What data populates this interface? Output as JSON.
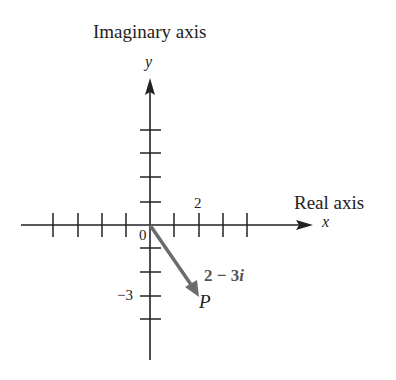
{
  "axes": {
    "imaginary_axis_title": "Imaginary axis",
    "real_axis_title": "Real axis",
    "y_variable": "y",
    "x_variable": "x"
  },
  "ticks": {
    "x_label_2": "2",
    "origin": "0",
    "y_label_neg3": "−3",
    "x_tick_count_positive": 4,
    "x_tick_count_negative": 4,
    "y_tick_count_positive": 4,
    "y_tick_count_negative": 4
  },
  "point": {
    "name": "P",
    "complex_number_real": "2",
    "complex_number_op": " − ",
    "complex_number_imag": "3",
    "complex_number_unit": "i",
    "re": 2,
    "im": -3,
    "vector_color": "#666666"
  },
  "colors": {
    "axis": "#222222",
    "vector": "#6b6b6b",
    "label_highlight": "#555555"
  }
}
